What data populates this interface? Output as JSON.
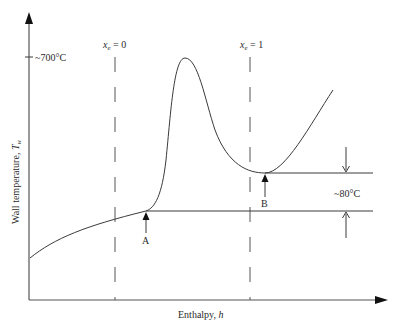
{
  "diagram": {
    "type": "wall-temperature-vs-enthalpy",
    "y_axis_label": "Wall temperature, ",
    "y_axis_symbol": "T",
    "y_axis_subscript": "w",
    "x_axis_label": "Enthalpy, ",
    "x_axis_symbol": "h",
    "y_tick_label": "~700°C",
    "dashed_lines": [
      {
        "symbol": "x",
        "subscript": "e",
        "value_text": " = 0"
      },
      {
        "symbol": "x",
        "subscript": "e",
        "value_text": " = 1"
      }
    ],
    "points": [
      {
        "label": "A"
      },
      {
        "label": "B"
      }
    ],
    "temperature_difference_label": "~80°C",
    "colors": {
      "line": "#3a3a3a",
      "background": "#ffffff"
    }
  }
}
